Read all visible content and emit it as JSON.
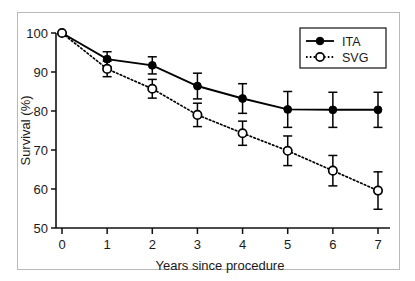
{
  "chart_data": {
    "type": "line",
    "title": "",
    "xlabel": "Years since procedure",
    "ylabel": "Survival (%)",
    "x": [
      0,
      1,
      2,
      3,
      4,
      5,
      6,
      7
    ],
    "xticklabels": [
      "0",
      "1",
      "2",
      "3",
      "4",
      "5",
      "6",
      "7"
    ],
    "yticklabels": [
      "50",
      "60",
      "70",
      "80",
      "90",
      "100"
    ],
    "yticks": [
      50,
      60,
      70,
      80,
      90,
      100
    ],
    "xlim": [
      0,
      7
    ],
    "ylim": [
      50,
      100
    ],
    "grid": false,
    "legend_position": "top-right",
    "series": [
      {
        "name": "ITA",
        "marker": "filled-circle",
        "linestyle": "solid",
        "color": "#000000",
        "values": [
          100.0,
          93.3,
          91.7,
          86.4,
          83.2,
          80.4,
          80.3,
          80.3
        ],
        "errors": [
          0.0,
          1.9,
          2.2,
          3.3,
          3.8,
          4.6,
          4.5,
          4.5
        ]
      },
      {
        "name": "SVG",
        "marker": "open-circle",
        "linestyle": "dotted",
        "color": "#000000",
        "values": [
          100.0,
          90.8,
          85.7,
          79.0,
          74.3,
          69.8,
          64.7,
          59.6
        ],
        "errors": [
          0.0,
          2.0,
          2.4,
          3.0,
          3.1,
          3.8,
          3.9,
          4.8
        ]
      }
    ]
  },
  "legend": {
    "entries": [
      {
        "label": "ITA",
        "marker": "filled-circle",
        "linestyle": "solid"
      },
      {
        "label": "SVG",
        "marker": "open-circle",
        "linestyle": "dotted"
      }
    ]
  },
  "axes": {
    "x_title": "Years since procedure",
    "y_title": "Survival (%)"
  }
}
